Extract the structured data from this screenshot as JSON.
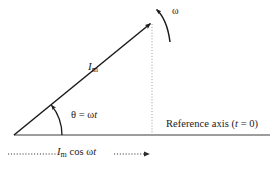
{
  "figure": {
    "type": "phasor-diagram",
    "background_color": "#ffffff",
    "ink_color": "#1a1a1a",
    "axis_color": "#808080",
    "dotted_color": "#4d4d4d"
  },
  "labels": {
    "phasor_magnitude": "I",
    "phasor_magnitude_sub": "m",
    "angle_equation": "θ = ω",
    "angle_equation_ital": "t",
    "angular_velocity": "ω",
    "reference_axis_pre": "Reference axis (",
    "reference_axis_ital": "t",
    "reference_axis_post": " = 0)",
    "projection_pre": "I",
    "projection_sub": "m",
    "projection_mid": " cos ω",
    "projection_ital": "t"
  },
  "geometry": {
    "origin_x": 14,
    "origin_y": 135,
    "tip_x": 152,
    "tip_y": 22,
    "axis_start_x": 14,
    "axis_end_x": 270,
    "axis_y": 135,
    "angle_degrees": 39,
    "arc_radius": 48,
    "projection_line_y": 154,
    "projection_start_x": 8,
    "projection_end_x": 152
  }
}
